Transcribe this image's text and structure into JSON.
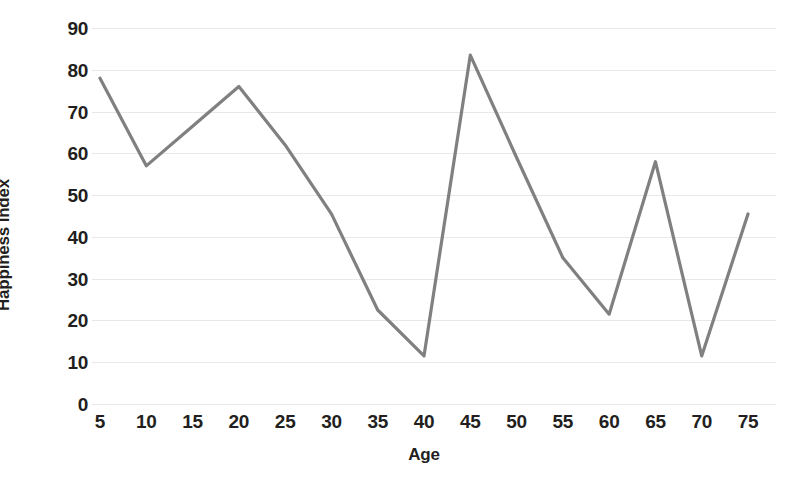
{
  "chart_data": {
    "type": "line",
    "title": "",
    "xlabel": "Age",
    "ylabel": "Happiness Index",
    "x": [
      5,
      10,
      15,
      20,
      25,
      30,
      35,
      40,
      45,
      50,
      55,
      60,
      65,
      70,
      75
    ],
    "values": [
      78,
      57,
      66.5,
      76,
      62,
      45.5,
      22.5,
      11.5,
      83.5,
      59,
      35,
      21.5,
      58,
      11.5,
      45.5
    ],
    "series": [
      {
        "name": "Happiness Index",
        "values": [
          78,
          57,
          66.5,
          76,
          62,
          45.5,
          22.5,
          11.5,
          83.5,
          59,
          35,
          21.5,
          58,
          11.5,
          45.5
        ]
      }
    ],
    "xlim": [
      5,
      75
    ],
    "ylim": [
      0,
      90
    ],
    "x_tick_labels": [
      "5",
      "10",
      "15",
      "20",
      "25",
      "30",
      "35",
      "40",
      "45",
      "50",
      "55",
      "60",
      "65",
      "70",
      "75"
    ],
    "y_tick_labels": [
      "0",
      "10",
      "20",
      "30",
      "40",
      "50",
      "60",
      "70",
      "80",
      "90"
    ],
    "y_ticks": [
      0,
      10,
      20,
      30,
      40,
      50,
      60,
      70,
      80,
      90
    ],
    "grid": "horizontal",
    "legend": "none",
    "line_color": "#808080",
    "gridline_color": "#e8e8ea",
    "background_color": "#ffffff",
    "markers": false
  }
}
